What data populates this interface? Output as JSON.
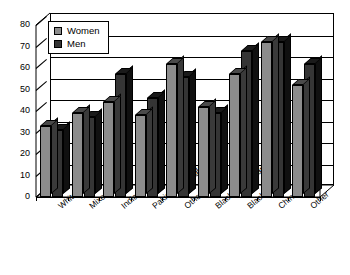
{
  "chart_data": {
    "type": "bar",
    "title": "",
    "xlabel": "",
    "ylabel": "",
    "ylim": [
      0,
      80
    ],
    "ytick_step": 10,
    "yticks": [
      "0",
      "10",
      "20",
      "30",
      "40",
      "50",
      "60",
      "70",
      "80"
    ],
    "grid": true,
    "legend_position": "top-left",
    "categories": [
      "White",
      "Mixed",
      "Indian",
      "Pakistani/Bangladeshi",
      "Other Asian",
      "Black Caribbean",
      "Black African",
      "Chinese",
      "Other"
    ],
    "series": [
      {
        "name": "Women",
        "color": "#8c8c8c",
        "values": [
          33,
          39,
          44,
          38,
          62,
          42,
          57,
          72,
          52
        ]
      },
      {
        "name": "Men",
        "color": "#353535",
        "values": [
          31,
          37,
          57,
          46,
          56,
          39,
          68,
          72,
          62
        ]
      }
    ]
  },
  "legend": {
    "items": [
      {
        "label": "Women",
        "swatch": "women-swatch"
      },
      {
        "label": "Men",
        "swatch": "men-swatch"
      }
    ]
  }
}
